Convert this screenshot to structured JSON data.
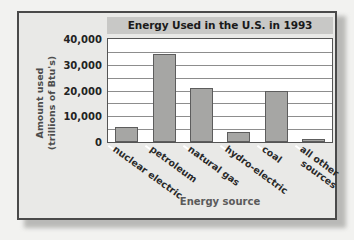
{
  "chart_data": {
    "type": "bar",
    "title": "Energy Used in the U.S. in 1993",
    "xlabel": "Energy source",
    "ylabel_line1": "Amount used",
    "ylabel_line2": "(trillions of Btu's)",
    "categories": [
      "nuclear electric",
      "petroleum",
      "natural gas",
      "hydro-electric",
      "coal",
      "all other sources"
    ],
    "category_lines": [
      [
        "nuclear electric"
      ],
      [
        "petroleum"
      ],
      [
        "natural gas"
      ],
      [
        "hydro-electric"
      ],
      [
        "coal"
      ],
      [
        "all other",
        "sources"
      ]
    ],
    "values": [
      6000,
      34000,
      21000,
      4000,
      20000,
      1000
    ],
    "ylim": [
      0,
      40000
    ],
    "ytick_labels": [
      "40,000",
      "30,000",
      "20,000",
      "10,000",
      "0"
    ],
    "ytick_values": [
      40000,
      30000,
      20000,
      10000,
      0
    ],
    "gridline_values": [
      40000,
      35000,
      30000,
      25000,
      20000,
      15000,
      10000,
      5000,
      0
    ],
    "grid": true,
    "legend": "none",
    "bar_color": "#a6a6a4",
    "bar_border_color": "#5d5d5d",
    "plot_bg": "#ffffff",
    "title_band_color": "#c8c8c6",
    "frame_color": "#4a4a4a",
    "page_bg": "#e9e9e7"
  }
}
